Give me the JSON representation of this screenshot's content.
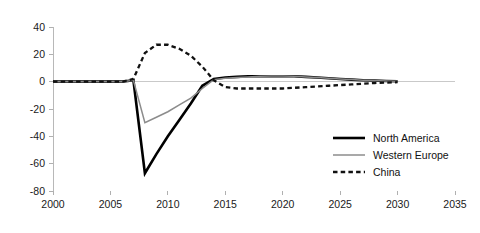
{
  "chart_data": {
    "type": "line",
    "title": "",
    "subtitle": "",
    "xlabel": "",
    "ylabel": "",
    "xlim": [
      2000,
      2035
    ],
    "ylim": [
      -80,
      40
    ],
    "xticks": [
      2000,
      2005,
      2010,
      2015,
      2020,
      2025,
      2030,
      2035
    ],
    "yticks": [
      40,
      20,
      0,
      -20,
      -40,
      -60,
      -80
    ],
    "xtick_labels": [
      "2000",
      "2005",
      "2010",
      "2015",
      "2020",
      "2025",
      "2030",
      "2035"
    ],
    "ytick_labels": [
      "40",
      "20",
      "0",
      "-20",
      "-40",
      "-60",
      "-80"
    ],
    "grid": false,
    "zero_line": true,
    "legend_position": "bottom-right",
    "x": [
      2000,
      2001,
      2002,
      2003,
      2004,
      2005,
      2006,
      2007,
      2008,
      2009,
      2010,
      2011,
      2012,
      2013,
      2014,
      2015,
      2016,
      2017,
      2018,
      2019,
      2020,
      2021,
      2022,
      2023,
      2024,
      2025,
      2026,
      2027,
      2028,
      2029,
      2030
    ],
    "series": [
      {
        "name": "North America",
        "color": "#000000",
        "style": "solid",
        "width": 2.6,
        "values": [
          0,
          0,
          0,
          0,
          0,
          0,
          0,
          1,
          -67,
          -53,
          -40,
          -28,
          -16,
          -3,
          2,
          3,
          3.5,
          4,
          4,
          4,
          4,
          4,
          3.5,
          3,
          2.5,
          2,
          1.5,
          1,
          0.8,
          0.5,
          0.3
        ]
      },
      {
        "name": "Western Europe",
        "color": "#8c8c8c",
        "style": "solid",
        "width": 1.5,
        "values": [
          0,
          0,
          0,
          0,
          0,
          0,
          0,
          1,
          -30,
          -26,
          -22,
          -17,
          -12,
          -5,
          1.5,
          2.5,
          3,
          3.5,
          4,
          4.2,
          4.2,
          4,
          3.5,
          3,
          2.5,
          2,
          1.5,
          1,
          0.8,
          0.5,
          0.3
        ]
      },
      {
        "name": "China",
        "color": "#111111",
        "style": "dashed",
        "width": 2.3,
        "values": [
          0,
          0,
          0,
          0,
          0,
          0,
          0,
          2,
          21,
          27,
          27,
          24,
          19,
          11,
          1,
          -4,
          -5,
          -5,
          -5,
          -5,
          -5,
          -4.5,
          -4,
          -3.5,
          -3,
          -2.5,
          -2,
          -1.5,
          -1,
          -0.7,
          -0.4
        ]
      }
    ],
    "legend": [
      {
        "label": "North America",
        "color": "#000000",
        "style": "solid",
        "width": 2.6
      },
      {
        "label": "Western Europe",
        "color": "#8c8c8c",
        "style": "solid",
        "width": 1.5
      },
      {
        "label": "China",
        "color": "#111111",
        "style": "dashed",
        "width": 2.3
      }
    ]
  },
  "layout": {
    "plot_left": 53,
    "plot_right": 455,
    "plot_top": 27,
    "plot_bottom": 191,
    "legend_x": 333,
    "legend_y": 138,
    "legend_row_gap": 17,
    "legend_line_len": 32,
    "legend_text_gap": 8
  }
}
